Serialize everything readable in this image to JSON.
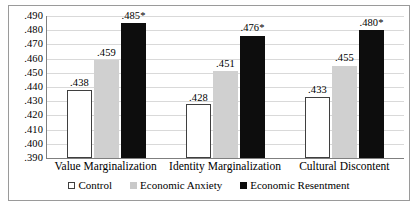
{
  "chart_data": {
    "type": "bar",
    "title": "",
    "subtitle": "",
    "xlabel": "",
    "ylabel": "",
    "ylim": [
      0.39,
      0.49
    ],
    "grid": true,
    "legend_position": "bottom",
    "categories": [
      "Value Marginalization",
      "Identity Marginalization",
      "Cultural Discontent"
    ],
    "yticks": [
      ".490",
      ".480",
      ".470",
      ".460",
      ".450",
      ".440",
      ".430",
      ".420",
      ".410",
      ".400",
      ".390"
    ],
    "ytick_values": [
      0.49,
      0.48,
      0.47,
      0.46,
      0.45,
      0.44,
      0.43,
      0.42,
      0.41,
      0.4,
      0.39
    ],
    "series": [
      {
        "name": "Control",
        "color": "#ffffff",
        "border_color": "#3f3f3f",
        "values": [
          0.438,
          0.428,
          0.433
        ],
        "labels": [
          ".438",
          ".428",
          ".433"
        ]
      },
      {
        "name": "Economic Anxiety",
        "color": "#d0d0d0",
        "border_color": "",
        "values": [
          0.459,
          0.451,
          0.455
        ],
        "labels": [
          ".459",
          ".451",
          ".455"
        ]
      },
      {
        "name": "Economic Resentment",
        "color": "#0d0d0d",
        "border_color": "",
        "values": [
          0.485,
          0.476,
          0.48
        ],
        "labels": [
          ".485*",
          ".476*",
          ".480*"
        ]
      }
    ]
  },
  "legend": {
    "items": [
      {
        "label": "Control",
        "style": "control"
      },
      {
        "label": "Economic Anxiety",
        "style": "anxiety"
      },
      {
        "label": "Economic Resentment",
        "style": "resentment"
      }
    ]
  }
}
